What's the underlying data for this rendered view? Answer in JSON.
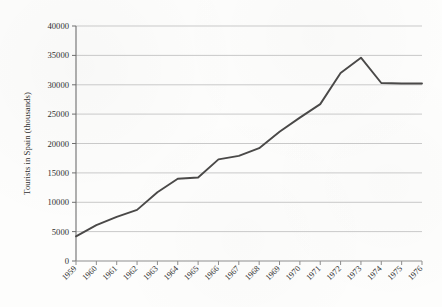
{
  "chart_data": {
    "type": "line",
    "title": "",
    "xlabel": "",
    "ylabel": "Tourists in Spain (thousands)",
    "categories": [
      "1959",
      "1960",
      "1961",
      "1962",
      "1963",
      "1964",
      "1965",
      "1966",
      "1967",
      "1968",
      "1969",
      "1970",
      "1971",
      "1972",
      "1973",
      "1974",
      "1975",
      "1976"
    ],
    "values": [
      4200,
      6100,
      7500,
      8700,
      11700,
      14000,
      14200,
      17300,
      17900,
      19200,
      22000,
      24400,
      26700,
      32000,
      34600,
      30300,
      30200,
      30200
    ],
    "series": [
      {
        "name": "Tourists in Spain (thousands)",
        "values": [
          4200,
          6100,
          7500,
          8700,
          11700,
          14000,
          14200,
          17300,
          17900,
          19200,
          22000,
          24400,
          26700,
          32000,
          34600,
          30300,
          30200,
          30200
        ]
      }
    ],
    "yticks": [
      0,
      5000,
      10000,
      15000,
      20000,
      25000,
      30000,
      35000,
      40000
    ],
    "ytick_labels": [
      "0",
      "5000",
      "10000",
      "15000",
      "20000",
      "25000",
      "30000",
      "35000",
      "40000"
    ],
    "ylim": [
      0,
      40000
    ],
    "xlim": [
      "1959",
      "1976"
    ],
    "grid": "horizontal",
    "legend": "none",
    "line_color": "#4a4948",
    "grid_color": "#c9c9c9",
    "axis_color": "#6e6e6e",
    "background_color": "#fdfdfc",
    "xtick_rotation": -45
  }
}
